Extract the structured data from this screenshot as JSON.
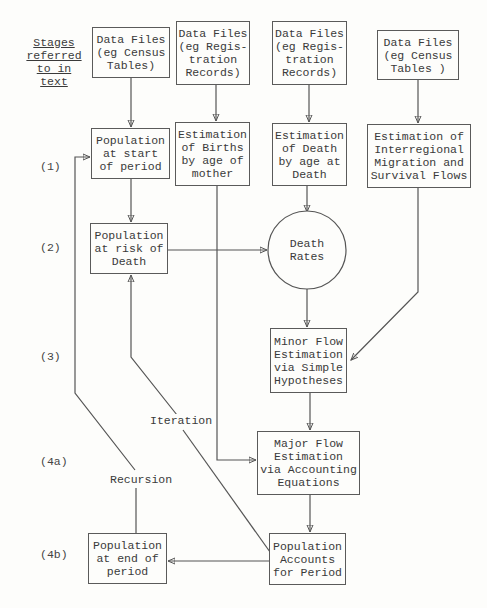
{
  "header": {
    "lines": [
      "Stages",
      "referred",
      "to in text"
    ]
  },
  "stages": [
    {
      "label": "(1)",
      "y": 160
    },
    {
      "label": "(2)",
      "y": 241
    },
    {
      "label": "(3)",
      "y": 350
    },
    {
      "label": "(4a)",
      "y": 455
    },
    {
      "label": "(4b)",
      "y": 548
    }
  ],
  "boxes": {
    "data_census_left": "Data Files\n(eg Census\nTables)",
    "data_reg_1": "Data Files\n(eg Regis-\ntration\nRecords)",
    "data_reg_2": "Data Files\n(eg Regis-\ntration\nRecords)",
    "data_census_right": "Data Files\n(eg Census\nTables )",
    "pop_start": "Population\nat start\nof period",
    "est_births": "Estimation\nof Births\nby age of\nmother",
    "est_death": "Estimation\nof Death\nby age at\nDeath",
    "est_migration": "Estimation of\nInterregional\nMigration and\nSurvival Flows",
    "pop_risk": "Population\nat risk of\nDeath",
    "death_rates": "Death\nRates",
    "minor_flow": "Minor Flow\nEstimation\nvia Simple\nHypotheses",
    "major_flow": "Major Flow\nEstimation\nvia Accounting\nEquations",
    "pop_accounts": "Population\nAccounts\nfor Period",
    "pop_end": "Population\nat end of\nperiod"
  },
  "labels": {
    "iteration": "Iteration",
    "recursion": "Recursion"
  }
}
